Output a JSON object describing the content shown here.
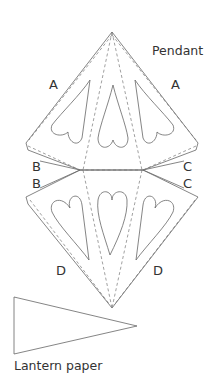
{
  "labels": {
    "pendant": "Pendant",
    "lantern_paper": "Lantern paper",
    "a_left": "A",
    "a_right": "A",
    "b_upper": "B",
    "b_lower": "B",
    "c_upper": "C",
    "c_lower": "C",
    "d_left": "D",
    "d_right": "D"
  },
  "colors": {
    "line": "#555555",
    "text": "#333333",
    "background": "#ffffff"
  }
}
